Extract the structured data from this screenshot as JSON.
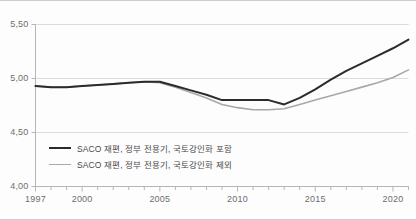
{
  "chart_data": {
    "type": "line",
    "title": "",
    "xlabel": "",
    "ylabel": "",
    "xlim": [
      1997,
      2021
    ],
    "ylim": [
      4.0,
      5.5
    ],
    "yticks": [
      4.0,
      4.5,
      5.0,
      5.5
    ],
    "ytick_labels": [
      "4,00",
      "4,50",
      "5,00",
      "5,50"
    ],
    "xticks": [
      1997,
      1998,
      1999,
      2000,
      2001,
      2002,
      2003,
      2004,
      2005,
      2006,
      2007,
      2008,
      2009,
      2010,
      2011,
      2012,
      2013,
      2014,
      2015,
      2016,
      2017,
      2018,
      2019,
      2020,
      2021
    ],
    "xtick_labels_shown": [
      "1997",
      "2000",
      "2005",
      "2010",
      "2015",
      "2020"
    ],
    "xtick_label_years": [
      1997,
      2000,
      2005,
      2010,
      2015,
      2020
    ],
    "grid": "horizontal",
    "legend_position": "inside-bottom-left",
    "x": [
      1997,
      1998,
      1999,
      2000,
      2001,
      2002,
      2003,
      2004,
      2005,
      2006,
      2007,
      2008,
      2009,
      2010,
      2011,
      2012,
      2013,
      2014,
      2015,
      2016,
      2017,
      2018,
      2019,
      2020,
      2021
    ],
    "series": [
      {
        "name": "SACO 재편, 정부 전용기, 국토강인화 포함",
        "color": "#2b2b2b",
        "values": [
          4.93,
          4.92,
          4.92,
          4.93,
          4.94,
          4.95,
          4.96,
          4.97,
          4.97,
          4.93,
          4.89,
          4.85,
          4.8,
          4.8,
          4.8,
          4.8,
          4.76,
          4.82,
          4.9,
          4.99,
          5.07,
          5.14,
          5.21,
          5.28,
          5.36
        ]
      },
      {
        "name": "SACO 재편, 정부 전용기, 국토강인화 제외",
        "color": "#a8a8a8",
        "values": [
          4.93,
          4.92,
          4.92,
          4.93,
          4.94,
          4.95,
          4.96,
          4.97,
          4.96,
          4.92,
          4.87,
          4.82,
          4.76,
          4.73,
          4.71,
          4.71,
          4.72,
          4.76,
          4.8,
          4.84,
          4.88,
          4.92,
          4.96,
          5.01,
          5.08
        ]
      }
    ],
    "legend": [
      {
        "label": "SACO 재편, 정부 전용기, 국토강인화 포함",
        "color": "#2b2b2b"
      },
      {
        "label": "SACO 재편, 정부 전용기, 국토강인화 제외",
        "color": "#a8a8a8"
      }
    ]
  },
  "style": {
    "axis_color": "#b5b5b5",
    "grid_color": "#dcdcdc",
    "tick_text_color": "#6d6d6d",
    "legend_text_color": "#4a4a4a",
    "background": "#fdfdfd"
  }
}
